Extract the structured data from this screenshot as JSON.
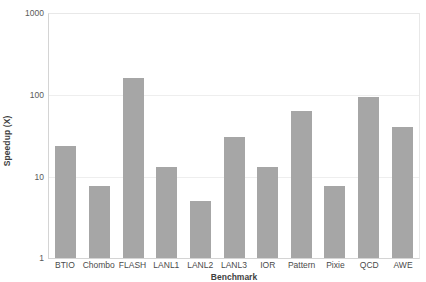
{
  "chart_data": {
    "type": "bar",
    "title": "",
    "xlabel": "Benchmark",
    "ylabel": "Speedup (X)",
    "yscale": "log",
    "ylim": [
      1,
      1000
    ],
    "ytick_labels": [
      "1000",
      "100",
      "10",
      "1"
    ],
    "ytick_values": [
      1000,
      100,
      10,
      1
    ],
    "grid": true,
    "legend": false,
    "bar_color": "#a6a6a6",
    "categories": [
      "BTIO",
      "Chombo",
      "FLASH",
      "LANL1",
      "LANL2",
      "LANL3",
      "IOR",
      "Pattern",
      "Pixie",
      "QCD",
      "AWE"
    ],
    "values": [
      23,
      7.5,
      155,
      13,
      5,
      30,
      13,
      62,
      7.5,
      92,
      40
    ]
  }
}
